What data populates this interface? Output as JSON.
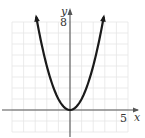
{
  "chart_data": {
    "type": "line",
    "title": "",
    "xlabel": "x",
    "ylabel": "y",
    "xlim": [
      -5,
      5
    ],
    "ylim": [
      -2,
      8
    ],
    "x_tick_labels": [
      "5"
    ],
    "y_tick_labels": [
      "8"
    ],
    "grid": true,
    "grid_step": 1,
    "series": [
      {
        "name": "y = x^2",
        "function": "x^2",
        "x_range": [
          -2.9,
          2.9
        ],
        "arrows_at_ends": true,
        "x": [
          -2.9,
          -2.5,
          -2,
          -1.5,
          -1,
          -0.5,
          0,
          0.5,
          1,
          1.5,
          2,
          2.5,
          2.9
        ],
        "values": [
          8.41,
          6.25,
          4,
          2.25,
          1,
          0.25,
          0,
          0.25,
          1,
          2.25,
          4,
          6.25,
          8.41
        ]
      }
    ],
    "colors": {
      "curve": "#1a1a1a",
      "axis": "#555555",
      "grid": "#e6e6e6"
    }
  }
}
